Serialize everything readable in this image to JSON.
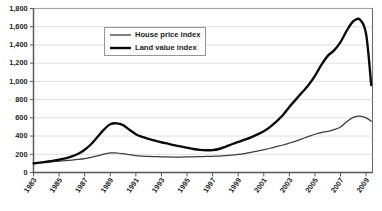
{
  "chart_data": {
    "type": "line",
    "title": "",
    "subtitle": "",
    "xlabel": "",
    "ylabel": "",
    "ylim": [
      0,
      1800
    ],
    "xlim": [
      1983,
      2009.5
    ],
    "grid": true,
    "legend_position": "top-center",
    "y_ticks": [
      "0",
      "200",
      "400",
      "600",
      "800",
      "1,000",
      "1,200",
      "1,400",
      "1,600",
      "1,800"
    ],
    "y_tick_values": [
      0,
      200,
      400,
      600,
      800,
      1000,
      1200,
      1400,
      1600,
      1800
    ],
    "x_ticks": [
      "1983",
      "1985",
      "1987",
      "1989",
      "1991",
      "1993",
      "1995",
      "1997",
      "1999",
      "2001",
      "2003",
      "2005",
      "2007",
      "2009"
    ],
    "x_tick_values": [
      1983,
      1985,
      1987,
      1989,
      1991,
      1993,
      1995,
      1997,
      1999,
      2001,
      2003,
      2005,
      2007,
      2009
    ],
    "x": [
      1983,
      1983.5,
      1984,
      1984.5,
      1985,
      1985.5,
      1986,
      1986.5,
      1987,
      1987.5,
      1988,
      1988.5,
      1989,
      1989.5,
      1990,
      1990.5,
      1991,
      1991.5,
      1992,
      1992.5,
      1993,
      1993.5,
      1994,
      1994.5,
      1995,
      1995.5,
      1996,
      1996.5,
      1997,
      1997.5,
      1998,
      1998.5,
      1999,
      1999.5,
      2000,
      2000.5,
      2001,
      2001.5,
      2002,
      2002.5,
      2003,
      2003.5,
      2004,
      2004.5,
      2005,
      2005.5,
      2006,
      2006.5,
      2007,
      2007.5,
      2008,
      2008.5,
      2009,
      2009.4
    ],
    "series": [
      {
        "name": "House price index",
        "style": "thin",
        "values": [
          100,
          106,
          112,
          118,
          124,
          130,
          136,
          143,
          152,
          165,
          182,
          202,
          215,
          214,
          206,
          196,
          186,
          180,
          176,
          174,
          172,
          171,
          170,
          170,
          171,
          172,
          174,
          176,
          178,
          180,
          184,
          190,
          198,
          208,
          220,
          234,
          250,
          266,
          284,
          302,
          322,
          344,
          370,
          396,
          420,
          438,
          452,
          470,
          500,
          560,
          605,
          620,
          600,
          562
        ]
      },
      {
        "name": "Land value index",
        "style": "thick",
        "values": [
          100,
          108,
          118,
          128,
          140,
          155,
          176,
          205,
          250,
          310,
          390,
          470,
          530,
          540,
          520,
          470,
          420,
          390,
          368,
          350,
          332,
          316,
          300,
          286,
          272,
          258,
          248,
          244,
          246,
          258,
          282,
          310,
          336,
          360,
          386,
          418,
          452,
          500,
          560,
          630,
          720,
          800,
          880,
          960,
          1060,
          1180,
          1280,
          1340,
          1430,
          1560,
          1660,
          1680,
          1520,
          960
        ]
      }
    ],
    "legend": [
      {
        "label": "House price index",
        "style": "thin"
      },
      {
        "label": "Land value index",
        "style": "thick"
      }
    ]
  }
}
